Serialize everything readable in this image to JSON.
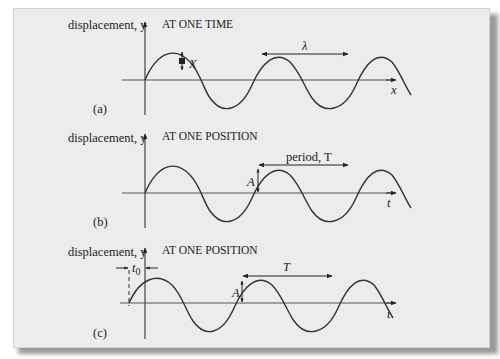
{
  "colors": {
    "background": "#ececec",
    "ink": "#222222",
    "shadow": "#9a9a9a"
  },
  "panels": [
    {
      "id": "a",
      "label": "(a)",
      "axis_label": "displacement, y",
      "title": "AT ONE TIME",
      "horizontal_axis": "x",
      "annotations": {
        "point": "X",
        "wavelength": "λ"
      }
    },
    {
      "id": "b",
      "label": "(b)",
      "axis_label": "displacement, y",
      "title": "AT ONE POSITION",
      "horizontal_axis": "t",
      "annotations": {
        "amplitude": "A",
        "period": "period, T"
      }
    },
    {
      "id": "c",
      "label": "(c)",
      "axis_label": "displacement, y",
      "title": "AT ONE POSITION",
      "horizontal_axis": "t",
      "annotations": {
        "amplitude": "A",
        "period": "T",
        "offset": "t",
        "offset_sub": "0"
      }
    }
  ]
}
